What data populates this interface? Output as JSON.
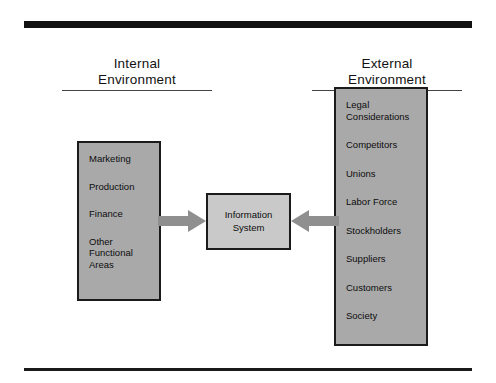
{
  "figure": {
    "title_internal": "Internal\nEnvironment",
    "title_external": "External\nEnvironment",
    "center_label": "Information\nSystem",
    "internal_items": [
      "Marketing",
      "Production",
      "Finance",
      "Other\nFunctional\nAreas"
    ],
    "external_items": [
      "Legal\nConsiderations",
      "Competitors",
      "Unions",
      "Labor Force",
      "Stockholders",
      "Suppliers",
      "Customers",
      "Society"
    ],
    "colors": {
      "box_fill": "#a9a9a9",
      "center_fill": "#c9c9c9",
      "border": "#1b1b1b",
      "arrow": "#8f8f8f",
      "rule": "#111111",
      "text": "#0d0d0d"
    }
  }
}
